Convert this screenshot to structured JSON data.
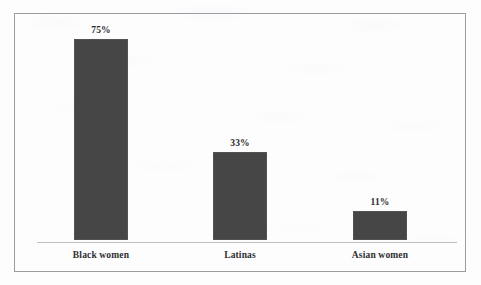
{
  "chart_data": {
    "type": "bar",
    "title": "",
    "subtitle": "",
    "xlabel": "",
    "ylabel": "",
    "categories": [
      "Black women",
      "Latinas",
      "Asian women"
    ],
    "values": [
      75,
      33,
      11
    ],
    "value_labels": [
      "75%",
      "33%",
      "11%"
    ],
    "unit": "%",
    "ylim": [
      0,
      75
    ],
    "grid": false,
    "legend": false,
    "legend_position": "none",
    "axis_ticks_visible": false,
    "series": [
      {
        "name": "",
        "values": [
          75,
          33,
          11
        ]
      }
    ]
  },
  "style": {
    "bar_color": "#464646",
    "frame_border_color": "#9a9ca1",
    "axis_line_color": "#bcbec3",
    "background_color": "#fdfdfe",
    "value_label_color": "#2b2b2b",
    "category_label_color": "#2e2e2e"
  }
}
